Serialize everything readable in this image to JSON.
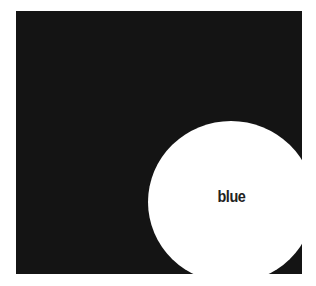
{
  "figure": {
    "background_color": "#141414",
    "circle_color": "#ffffff",
    "circle_label": "blue"
  }
}
